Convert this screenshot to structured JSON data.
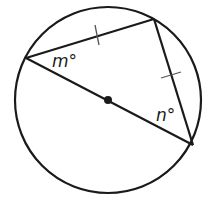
{
  "diagram": {
    "type": "circle-inscribed-triangle",
    "circle": {
      "cx": 108,
      "cy": 100,
      "r": 93
    },
    "center_point": {
      "x": 108,
      "y": 100
    },
    "vertices": {
      "left": {
        "x": 26,
        "y": 58
      },
      "top": {
        "x": 154,
        "y": 19
      },
      "bottom_right": {
        "x": 193,
        "y": 145
      }
    },
    "diameter": "left to bottom_right through center",
    "congruent_sides": [
      "left-top",
      "top-bottom_right"
    ],
    "labels": {
      "angle_m": "m°",
      "angle_n": "n°"
    },
    "colors": {
      "stroke": "#1a1a1a",
      "tick": "#555555",
      "background": "#ffffff"
    }
  }
}
